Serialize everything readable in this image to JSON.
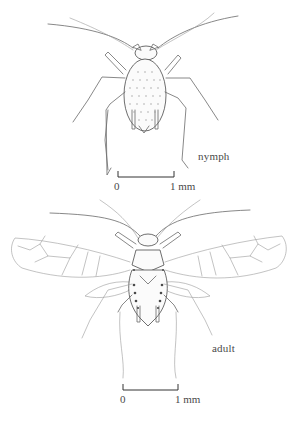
{
  "figure": {
    "panels": [
      {
        "id": "nymph",
        "label": "nymph",
        "scale_bar": {
          "start_label": "0",
          "end_label": "1 mm"
        }
      },
      {
        "id": "adult",
        "label": "adult",
        "scale_bar": {
          "start_label": "0",
          "end_label": "1 mm"
        }
      }
    ]
  }
}
